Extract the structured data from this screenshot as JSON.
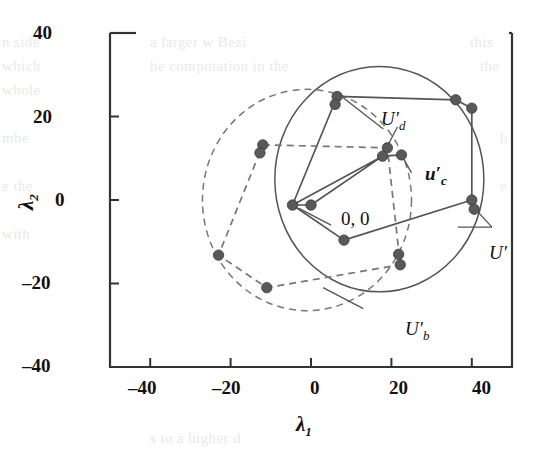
{
  "figure": {
    "background_text": [
      {
        "text": "n side",
        "x": 2,
        "y": 34
      },
      {
        "text": "which",
        "x": 2,
        "y": 58
      },
      {
        "text": "whole",
        "x": 2,
        "y": 82
      },
      {
        "text": "mbe",
        "x": 2,
        "y": 130
      },
      {
        "text": "e  the",
        "x": 2,
        "y": 178
      },
      {
        "text": "with",
        "x": 2,
        "y": 226
      },
      {
        "text": "a larger w  Bezi",
        "x": 150,
        "y": 34
      },
      {
        "text": "he computation in the",
        "x": 150,
        "y": 58
      },
      {
        "text": "s  to  a  higher  d",
        "x": 150,
        "y": 430
      },
      {
        "text": "this",
        "x": 470,
        "y": 34
      },
      {
        "text": "the",
        "x": 480,
        "y": 58
      },
      {
        "text": "h",
        "x": 500,
        "y": 130
      },
      {
        "text": "e",
        "x": 500,
        "y": 178
      }
    ],
    "axes": {
      "x_label": "λ",
      "x_label_sub": "1",
      "y_label": "λ",
      "y_label_sub": "2",
      "x_ticks": [
        "–40",
        "–20",
        "0",
        "20",
        "40"
      ],
      "y_ticks": [
        "40",
        "20",
        "0",
        "–20",
        "–40"
      ]
    },
    "annotations": [
      {
        "name": "label-Ud",
        "text": "U",
        "prime": "′",
        "sub": "d"
      },
      {
        "name": "label-uc",
        "text": "u",
        "prime": "′",
        "sub": "c"
      },
      {
        "name": "label-U",
        "text": "U",
        "prime": "′",
        "sub": ""
      },
      {
        "name": "label-Ub",
        "text": "U",
        "prime": "′",
        "sub": "b"
      },
      {
        "name": "label-origin",
        "text": "0, 0"
      }
    ],
    "colors": {
      "stroke": "#555555",
      "marker": "#595959",
      "axis": "#333333",
      "dashed": "#777777"
    }
  },
  "chart_data": {
    "type": "scatter",
    "title": "",
    "xlabel": "λ1",
    "ylabel": "λ2",
    "xlim": [
      -50,
      50
    ],
    "ylim": [
      -40,
      40
    ],
    "xticks": [
      -40,
      -20,
      0,
      20,
      40
    ],
    "yticks": [
      -40,
      -20,
      0,
      20,
      40
    ],
    "grid": false,
    "legend": "none",
    "points": [
      {
        "x": 6.5,
        "y": 24.8,
        "label": ""
      },
      {
        "x": 6.0,
        "y": 22.9,
        "label": ""
      },
      {
        "x": 36.0,
        "y": 24.0,
        "label": ""
      },
      {
        "x": 40.0,
        "y": 22.0,
        "label": ""
      },
      {
        "x": -12.0,
        "y": 13.2,
        "label": ""
      },
      {
        "x": -12.7,
        "y": 11.3,
        "label": ""
      },
      {
        "x": 19.0,
        "y": 12.5,
        "label": ""
      },
      {
        "x": 17.8,
        "y": 10.5,
        "label": ""
      },
      {
        "x": 22.5,
        "y": 10.8,
        "label": ""
      },
      {
        "x": -4.6,
        "y": -1.2,
        "label": ""
      },
      {
        "x": 0.0,
        "y": -1.2,
        "label": "0, 0"
      },
      {
        "x": 8.2,
        "y": -9.6,
        "label": ""
      },
      {
        "x": 40.0,
        "y": 0.0,
        "label": ""
      },
      {
        "x": 40.6,
        "y": -2.2,
        "label": ""
      },
      {
        "x": 21.8,
        "y": -13.0,
        "label": ""
      },
      {
        "x": 22.2,
        "y": -15.5,
        "label": ""
      },
      {
        "x": -23.0,
        "y": -13.2,
        "label": ""
      },
      {
        "x": -11.0,
        "y": -21.0,
        "label": ""
      }
    ],
    "series": [
      {
        "name": "U' solid polygon",
        "style": "solid",
        "closed": true,
        "vertices": [
          {
            "x": 6.5,
            "y": 24.8
          },
          {
            "x": 36.0,
            "y": 24.0
          },
          {
            "x": 40.0,
            "y": 22.0
          },
          {
            "x": 40.0,
            "y": 0.0
          },
          {
            "x": 8.2,
            "y": -9.6
          },
          {
            "x": -4.6,
            "y": -1.2
          }
        ]
      },
      {
        "name": "U'_b dashed polygon",
        "style": "dashed",
        "closed": true,
        "vertices": [
          {
            "x": -12.0,
            "y": 13.2
          },
          {
            "x": 19.0,
            "y": 12.5
          },
          {
            "x": 22.2,
            "y": -15.5
          },
          {
            "x": -11.0,
            "y": -21.0
          },
          {
            "x": -23.0,
            "y": -13.2
          }
        ]
      },
      {
        "name": "u'_c spokes",
        "style": "solid",
        "closed": false,
        "vertices": [
          {
            "x": 17.8,
            "y": 10.5
          },
          {
            "x": -4.6,
            "y": -1.2
          },
          {
            "x": 0.0,
            "y": -1.2
          },
          {
            "x": 17.8,
            "y": 10.5
          },
          {
            "x": 22.5,
            "y": 10.8
          }
        ]
      }
    ],
    "curves": [
      {
        "name": "U' ellipse",
        "style": "solid",
        "cx": 17.0,
        "cy": 5.0,
        "rx": 26.0,
        "ry": 27.0
      },
      {
        "name": "U'_b ellipse",
        "style": "dashed",
        "cx": -1.0,
        "cy": 0.0,
        "rx": 26.0,
        "ry": 26.5
      }
    ]
  }
}
